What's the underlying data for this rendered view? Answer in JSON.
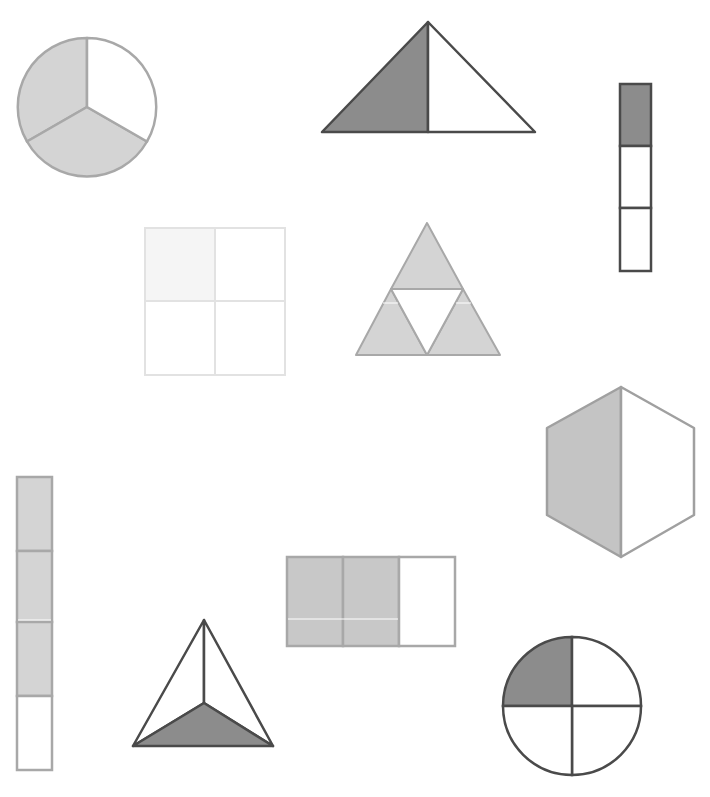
{
  "colors": {
    "dark_fill": "#8c8c8c",
    "dark_stroke": "#4a4a4a",
    "light_fill": "#d4d4d4",
    "light_stroke": "#a8a8a8",
    "faint_fill": "#f5f5f5",
    "faint_stroke": "#e2e2e2",
    "white": "#ffffff"
  },
  "shapes": [
    {
      "id": "circle-thirds",
      "type": "circle",
      "parts": 3,
      "shaded": 2,
      "fraction": "2/3"
    },
    {
      "id": "triangle-halves",
      "type": "triangle",
      "parts": 2,
      "shaded": 1,
      "fraction": "1/2"
    },
    {
      "id": "vertical-strip-thirds",
      "type": "strip",
      "parts": 3,
      "shaded": 1,
      "fraction": "1/3"
    },
    {
      "id": "square-quarters",
      "type": "square",
      "parts": 4,
      "shaded": 1,
      "fraction": "1/4"
    },
    {
      "id": "triforce-quarters",
      "type": "triangle",
      "parts": 4,
      "shaded": 3,
      "fraction": "3/4"
    },
    {
      "id": "hexagon-halves",
      "type": "hexagon",
      "parts": 2,
      "shaded": 1,
      "fraction": "1/2"
    },
    {
      "id": "vertical-strip-quarters",
      "type": "strip",
      "parts": 4,
      "shaded": 3,
      "fraction": "3/4"
    },
    {
      "id": "rectangle-thirds",
      "type": "rectangle",
      "parts": 3,
      "shaded": 2,
      "fraction": "2/3"
    },
    {
      "id": "triangle-thirds",
      "type": "triangle",
      "parts": 3,
      "shaded": 1,
      "fraction": "1/3"
    },
    {
      "id": "circle-quarters",
      "type": "circle",
      "parts": 4,
      "shaded": 1,
      "fraction": "1/4"
    }
  ]
}
